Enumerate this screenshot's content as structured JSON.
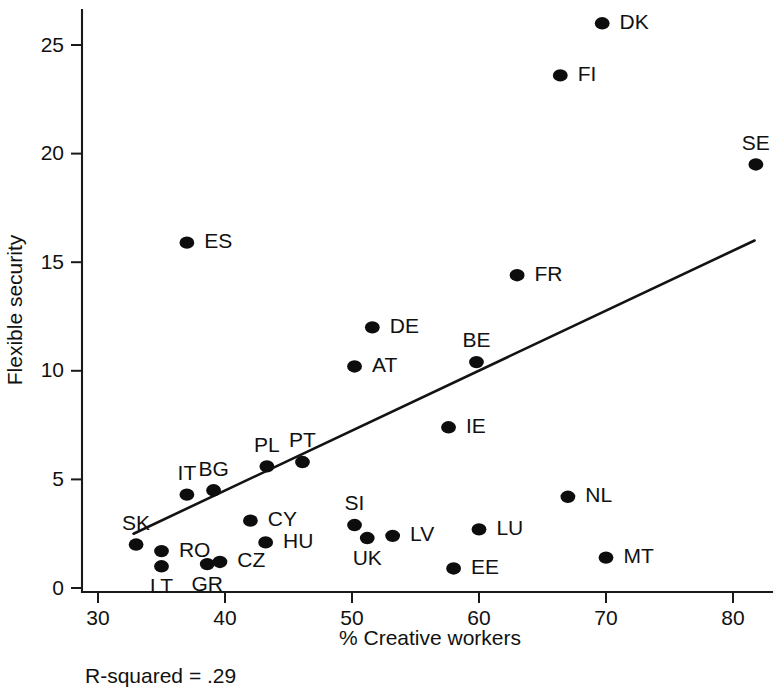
{
  "chart_data": {
    "type": "scatter",
    "title": "",
    "xlabel": "% Creative workers",
    "ylabel": "Flexible security",
    "xlim": [
      28.5,
      83.5
    ],
    "ylim": [
      -0.9,
      27.0
    ],
    "xticks": [
      30,
      40,
      50,
      60,
      70,
      80
    ],
    "yticks": [
      0,
      5,
      10,
      15,
      20,
      25
    ],
    "xtick_labels": [
      "30",
      "40",
      "50",
      "60",
      "70",
      "80"
    ],
    "ytick_labels": [
      "0",
      "5",
      "10",
      "15",
      "20",
      "25"
    ],
    "grid": false,
    "legend": "none",
    "annotation": "R-squared = .29",
    "r_squared": 0.29,
    "trendline": {
      "type": "linear-fit",
      "x_start": 32.8,
      "y_start": 2.5,
      "x_end": 81.7,
      "y_end": 16.0
    },
    "points": [
      {
        "label": "DK",
        "x": 69.7,
        "y": 26.0,
        "label_pos": "right"
      },
      {
        "label": "FI",
        "x": 66.4,
        "y": 23.6,
        "label_pos": "right"
      },
      {
        "label": "SE",
        "x": 81.8,
        "y": 19.5,
        "label_pos": "above"
      },
      {
        "label": "ES",
        "x": 37.0,
        "y": 15.9,
        "label_pos": "right"
      },
      {
        "label": "FR",
        "x": 63.0,
        "y": 14.4,
        "label_pos": "right"
      },
      {
        "label": "DE",
        "x": 51.6,
        "y": 12.0,
        "label_pos": "right"
      },
      {
        "label": "BE",
        "x": 59.8,
        "y": 10.4,
        "label_pos": "above"
      },
      {
        "label": "AT",
        "x": 50.2,
        "y": 10.2,
        "label_pos": "right"
      },
      {
        "label": "IE",
        "x": 57.6,
        "y": 7.4,
        "label_pos": "right"
      },
      {
        "label": "PT",
        "x": 46.1,
        "y": 5.8,
        "label_pos": "above"
      },
      {
        "label": "PL",
        "x": 43.3,
        "y": 5.6,
        "label_pos": "above"
      },
      {
        "label": "BG",
        "x": 39.1,
        "y": 4.5,
        "label_pos": "above"
      },
      {
        "label": "IT",
        "x": 37.0,
        "y": 4.3,
        "label_pos": "above"
      },
      {
        "label": "NL",
        "x": 67.0,
        "y": 4.2,
        "label_pos": "right"
      },
      {
        "label": "CY",
        "x": 42.0,
        "y": 3.1,
        "label_pos": "right"
      },
      {
        "label": "SI",
        "x": 50.2,
        "y": 2.9,
        "label_pos": "above"
      },
      {
        "label": "LU",
        "x": 60.0,
        "y": 2.7,
        "label_pos": "right"
      },
      {
        "label": "LV",
        "x": 53.2,
        "y": 2.4,
        "label_pos": "right"
      },
      {
        "label": "UK",
        "x": 51.2,
        "y": 2.3,
        "label_pos": "below"
      },
      {
        "label": "HU",
        "x": 43.2,
        "y": 2.1,
        "label_pos": "right"
      },
      {
        "label": "SK",
        "x": 33.0,
        "y": 2.0,
        "label_pos": "above"
      },
      {
        "label": "RO",
        "x": 35.0,
        "y": 1.7,
        "label_pos": "right"
      },
      {
        "label": "MT",
        "x": 70.0,
        "y": 1.4,
        "label_pos": "right"
      },
      {
        "label": "CZ",
        "x": 39.6,
        "y": 1.2,
        "label_pos": "right"
      },
      {
        "label": "GR",
        "x": 38.6,
        "y": 1.1,
        "label_pos": "below"
      },
      {
        "label": "LT",
        "x": 35.0,
        "y": 1.0,
        "label_pos": "below"
      },
      {
        "label": "EE",
        "x": 58.0,
        "y": 0.9,
        "label_pos": "right"
      }
    ]
  }
}
